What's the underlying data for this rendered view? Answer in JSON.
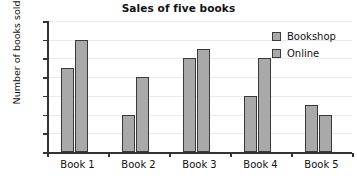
{
  "chart_data": {
    "type": "bar",
    "title": "Sales of five books",
    "xlabel": "",
    "ylabel": "Number of books sold",
    "categories": [
      "Book 1",
      "Book 2",
      "Book 3",
      "Book 4",
      "Book 5"
    ],
    "series": [
      {
        "name": "Bookshop",
        "values": [
          90,
          40,
          100,
          60,
          50
        ],
        "color": "#a9a9a9"
      },
      {
        "name": "Online",
        "values": [
          120,
          80,
          110,
          100,
          40
        ],
        "color": "#a9a9a9"
      }
    ],
    "ylim": [
      0,
      140
    ],
    "yticks": [
      0,
      20,
      40,
      60,
      80,
      100,
      120,
      140
    ],
    "ytick_labels": [
      "0",
      "20",
      "40",
      "60",
      "80",
      "100",
      "120",
      "140"
    ],
    "grid": true,
    "legend_position": "top-right"
  },
  "colors": {
    "bar_fill": "#a9a9a9",
    "bar_stroke": "#3a3a3a",
    "axis": "#333333",
    "gridline": "#eceaea",
    "text": "#111111",
    "background": "#ffffff"
  }
}
